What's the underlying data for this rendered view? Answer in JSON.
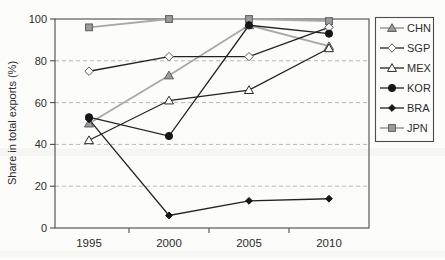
{
  "window": {
    "width": 445,
    "height": 260
  },
  "chart_data": {
    "type": "line",
    "title": "",
    "xlabel": "",
    "ylabel": "Share in total exports (%)",
    "x_categories": [
      "1995",
      "2000",
      "2005",
      "2010"
    ],
    "ylim": [
      0,
      100
    ],
    "yticks": [
      0,
      20,
      40,
      60,
      80,
      100
    ],
    "grid": "horizontal dashed gridlines at 20, 40, 60, 80",
    "legend_position": "right outside plot, boxed, vertical",
    "series": [
      {
        "name": "CHN",
        "marker": "triangle-filled-gray",
        "line": "gray",
        "values": [
          50,
          73,
          97,
          87
        ]
      },
      {
        "name": "SGP",
        "marker": "diamond-open",
        "line": "black",
        "values": [
          75,
          82,
          82,
          96
        ]
      },
      {
        "name": "MEX",
        "marker": "triangle-open",
        "line": "black",
        "values": [
          42,
          61,
          66,
          86
        ]
      },
      {
        "name": "KOR",
        "marker": "circle-filled",
        "line": "black",
        "values": [
          53,
          44,
          97,
          93
        ]
      },
      {
        "name": "BRA",
        "marker": "diamond-filled",
        "line": "black",
        "values": [
          52,
          6,
          13,
          14
        ]
      },
      {
        "name": "JPN",
        "marker": "square-filled-gray",
        "line": "gray",
        "values": [
          96,
          100,
          100,
          99
        ]
      }
    ],
    "colors": {
      "gray_line": "#a8a8a8",
      "black_line": "#222222",
      "gray_fill": "#9b9b9b",
      "gray_stroke": "#5c5c5c",
      "open_fill": "#ffffff",
      "dark_fill": "#161616",
      "grid": "#b8b8b8",
      "spine": "#4a4a4a",
      "text": "#2d2d2d",
      "background": "#fcfcfa"
    }
  }
}
